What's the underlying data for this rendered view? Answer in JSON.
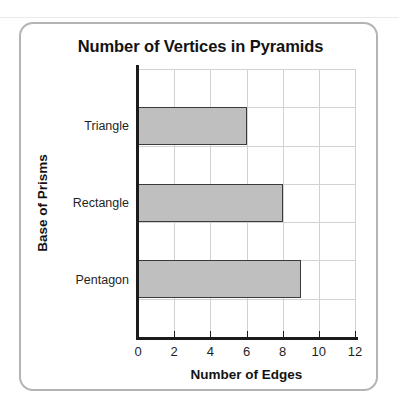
{
  "card": {
    "border_color": "#b4b4b4"
  },
  "chart_data": {
    "type": "bar",
    "orientation": "horizontal",
    "title": "Number of Vertices in Pyramids",
    "xlabel": "Number of Edges",
    "ylabel": "Base of Prisms",
    "categories": [
      "Triangle",
      "Rectangle",
      "Pentagon"
    ],
    "values": [
      6,
      8,
      9
    ],
    "xlim": [
      0,
      12
    ],
    "xticks": [
      0,
      2,
      4,
      6,
      8,
      10,
      12
    ],
    "xtick_labels": [
      "0",
      "2",
      "4",
      "6",
      "8",
      "10",
      "12"
    ],
    "grid": true,
    "legend": false,
    "bar_fill": "#bfbfbf",
    "bar_edge": "#3a3a3a",
    "axis_color": "#1b1b1b",
    "grid_color": "#d2d2d2",
    "band_count": 7,
    "bar_bands": [
      2,
      4,
      6
    ]
  }
}
